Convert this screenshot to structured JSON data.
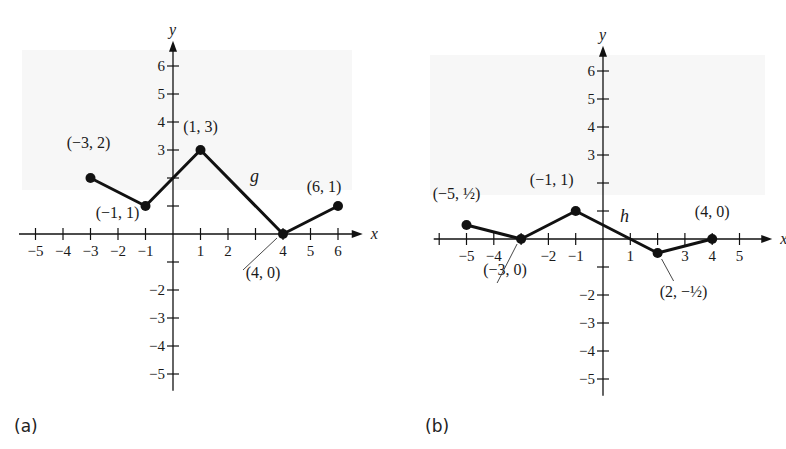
{
  "chart_data": [
    {
      "type": "line",
      "panel_label": "(a)",
      "function_name": "g",
      "xlabel": "x",
      "ylabel": "y",
      "xlim": [
        -5,
        6
      ],
      "ylim": [
        -5,
        6
      ],
      "x_ticks": [
        -5,
        -4,
        -3,
        -2,
        -1,
        1,
        2,
        3,
        4,
        5,
        6
      ],
      "x_tick_labels": [
        "−5",
        "−4",
        "−3",
        "−2",
        "−1",
        "1",
        "2",
        "",
        "4",
        "5",
        "6"
      ],
      "y_ticks": [
        -5,
        -4,
        -3,
        -2,
        -1,
        1,
        2,
        3,
        4,
        5,
        6
      ],
      "y_tick_labels": [
        "−5",
        "−4",
        "−3",
        "−2",
        "",
        "",
        "",
        "3",
        "4",
        "5",
        "6"
      ],
      "grid": false,
      "points": [
        {
          "x": -3,
          "y": 2,
          "label": "(−3, 2)"
        },
        {
          "x": -1,
          "y": 1,
          "label": "(−1, 1)"
        },
        {
          "x": 1,
          "y": 3,
          "label": "(1, 3)"
        },
        {
          "x": 4,
          "y": 0,
          "label": "(4, 0)"
        },
        {
          "x": 6,
          "y": 1,
          "label": "(6, 1)"
        }
      ]
    },
    {
      "type": "line",
      "panel_label": "(b)",
      "function_name": "h",
      "xlabel": "x",
      "ylabel": "y",
      "xlim": [
        -6,
        5
      ],
      "ylim": [
        -5,
        6
      ],
      "x_ticks": [
        -6,
        -5,
        -4,
        -3,
        -2,
        -1,
        1,
        2,
        3,
        4,
        5
      ],
      "x_tick_labels": [
        "",
        "−5",
        "−4",
        "",
        "−2",
        "−1",
        "1",
        "",
        "3",
        "4",
        "5"
      ],
      "y_ticks": [
        -5,
        -4,
        -3,
        -2,
        -1,
        1,
        2,
        3,
        4,
        5,
        6
      ],
      "y_tick_labels": [
        "−5",
        "−4",
        "−3",
        "−2",
        "",
        "",
        "",
        "3",
        "4",
        "5",
        "6"
      ],
      "grid": false,
      "points": [
        {
          "x": -5,
          "y": 0.5,
          "label": "(−5, ½)"
        },
        {
          "x": -3,
          "y": 0,
          "label": "(−3, 0)"
        },
        {
          "x": -1,
          "y": 1,
          "label": "(−1, 1)"
        },
        {
          "x": 2,
          "y": -0.5,
          "label": "(2, −½)"
        },
        {
          "x": 4,
          "y": 0,
          "label": "(4, 0)"
        }
      ]
    }
  ],
  "labels": {
    "panel_a": "(a)",
    "panel_b": "(b)",
    "func_a": "g",
    "func_b": "h",
    "axis_x": "x",
    "axis_y": "y"
  }
}
